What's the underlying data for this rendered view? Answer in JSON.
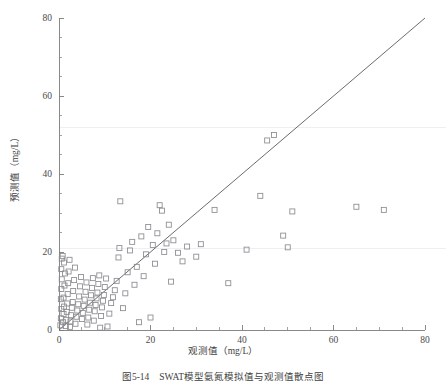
{
  "figure": {
    "caption": "图5-14　SWAT模型氨氮模拟值与观测值散点图",
    "x_axis_title": "观测值（mg/L）",
    "y_axis_title": "预测值（mg/L）"
  },
  "colors": {
    "marker_stroke": "#8a8a90",
    "axis": "#7c7c7c",
    "identity_line": "#5a5a5a",
    "gridline": "#ededf1",
    "background": "#ffffff"
  },
  "chart_data": {
    "type": "scatter",
    "title": "",
    "xlabel": "观测值（mg/L）",
    "ylabel": "预测值（mg/L）",
    "xlim": [
      0,
      80
    ],
    "ylim": [
      0,
      80
    ],
    "xticks": [
      0,
      20,
      40,
      60,
      80
    ],
    "yticks": [
      0,
      20,
      40,
      60,
      80
    ],
    "xtick_labels": [
      "0",
      "20",
      "40",
      "60",
      "80"
    ],
    "ytick_labels": [
      "0",
      "20",
      "40",
      "60",
      "80"
    ],
    "minor_tick_interval": 5,
    "tick_direction": "in",
    "grid": "faint-horizontal",
    "gridline_values": [
      21,
      52
    ],
    "legend": null,
    "annotations": [
      {
        "type": "line",
        "name": "identity-line",
        "label": "1:1",
        "from": [
          0,
          0
        ],
        "to": [
          80,
          80
        ]
      }
    ],
    "marker_style": "open-square",
    "marker_size": 5,
    "points": [
      [
        0.3,
        1.2
      ],
      [
        0.4,
        3.0
      ],
      [
        0.5,
        5.4
      ],
      [
        0.4,
        7.9
      ],
      [
        0.5,
        10.5
      ],
      [
        0.6,
        13.0
      ],
      [
        0.5,
        15.6
      ],
      [
        0.6,
        18.3
      ],
      [
        0.8,
        19.0
      ],
      [
        0.9,
        2.0
      ],
      [
        1.0,
        4.1
      ],
      [
        1.1,
        6.0
      ],
      [
        1.0,
        8.3
      ],
      [
        1.2,
        11.4
      ],
      [
        1.3,
        14.5
      ],
      [
        1.1,
        17.3
      ],
      [
        1.5,
        1.0
      ],
      [
        1.6,
        2.6
      ],
      [
        1.7,
        4.6
      ],
      [
        1.8,
        6.8
      ],
      [
        1.9,
        9.2
      ],
      [
        2.0,
        12.0
      ],
      [
        2.1,
        15.0
      ],
      [
        2.3,
        18.0
      ],
      [
        2.4,
        0.8
      ],
      [
        2.5,
        2.2
      ],
      [
        2.6,
        3.8
      ],
      [
        2.8,
        5.7
      ],
      [
        3.0,
        7.2
      ],
      [
        3.1,
        10.0
      ],
      [
        3.3,
        12.8
      ],
      [
        3.5,
        16.0
      ],
      [
        3.6,
        1.6
      ],
      [
        3.8,
        3.4
      ],
      [
        4.0,
        5.0
      ],
      [
        4.2,
        6.6
      ],
      [
        4.4,
        8.6
      ],
      [
        4.6,
        11.2
      ],
      [
        4.8,
        13.6
      ],
      [
        5.0,
        2.8
      ],
      [
        5.2,
        4.4
      ],
      [
        5.4,
        6.2
      ],
      [
        5.6,
        7.8
      ],
      [
        5.8,
        9.8
      ],
      [
        6.0,
        12.2
      ],
      [
        6.2,
        1.4
      ],
      [
        6.4,
        3.2
      ],
      [
        6.6,
        5.2
      ],
      [
        6.8,
        7.0
      ],
      [
        7.0,
        8.9
      ],
      [
        7.2,
        10.8
      ],
      [
        7.4,
        13.3
      ],
      [
        7.6,
        2.4
      ],
      [
        7.8,
        4.8
      ],
      [
        8.0,
        6.4
      ],
      [
        8.2,
        8.1
      ],
      [
        8.4,
        9.6
      ],
      [
        8.6,
        11.8
      ],
      [
        8.8,
        14.0
      ],
      [
        9.0,
        0.6
      ],
      [
        9.2,
        3.6
      ],
      [
        9.4,
        5.8
      ],
      [
        9.6,
        7.5
      ],
      [
        9.8,
        9.0
      ],
      [
        10.0,
        11.0
      ],
      [
        10.3,
        13.2
      ],
      [
        10.6,
        0.9
      ],
      [
        11.0,
        4.2
      ],
      [
        11.4,
        6.9
      ],
      [
        11.8,
        8.4
      ],
      [
        12.2,
        10.2
      ],
      [
        12.6,
        12.6
      ],
      [
        13.0,
        18.6
      ],
      [
        13.2,
        21.0
      ],
      [
        13.4,
        33.0
      ],
      [
        14.0,
        5.6
      ],
      [
        14.5,
        9.4
      ],
      [
        15.0,
        14.8
      ],
      [
        15.5,
        20.4
      ],
      [
        16.0,
        22.6
      ],
      [
        16.5,
        11.6
      ],
      [
        17.0,
        16.2
      ],
      [
        17.5,
        2.0
      ],
      [
        18.0,
        24.0
      ],
      [
        18.5,
        13.8
      ],
      [
        19.0,
        19.4
      ],
      [
        19.5,
        26.4
      ],
      [
        20.0,
        3.2
      ],
      [
        20.5,
        21.8
      ],
      [
        21.0,
        17.0
      ],
      [
        21.5,
        24.8
      ],
      [
        22.0,
        32.0
      ],
      [
        22.5,
        30.6
      ],
      [
        23.0,
        20.0
      ],
      [
        23.5,
        22.2
      ],
      [
        24.0,
        27.0
      ],
      [
        24.5,
        12.4
      ],
      [
        25.0,
        23.0
      ],
      [
        26.0,
        19.8
      ],
      [
        27.0,
        17.6
      ],
      [
        28.0,
        21.4
      ],
      [
        30.0,
        18.8
      ],
      [
        31.0,
        22.0
      ],
      [
        34.0,
        30.8
      ],
      [
        37.0,
        12.0
      ],
      [
        41.0,
        20.6
      ],
      [
        44.0,
        34.4
      ],
      [
        45.5,
        48.6
      ],
      [
        47.0,
        50.0
      ],
      [
        49.0,
        24.2
      ],
      [
        50.0,
        21.2
      ],
      [
        51.0,
        30.4
      ],
      [
        65.0,
        31.6
      ],
      [
        71.0,
        30.8
      ]
    ]
  }
}
